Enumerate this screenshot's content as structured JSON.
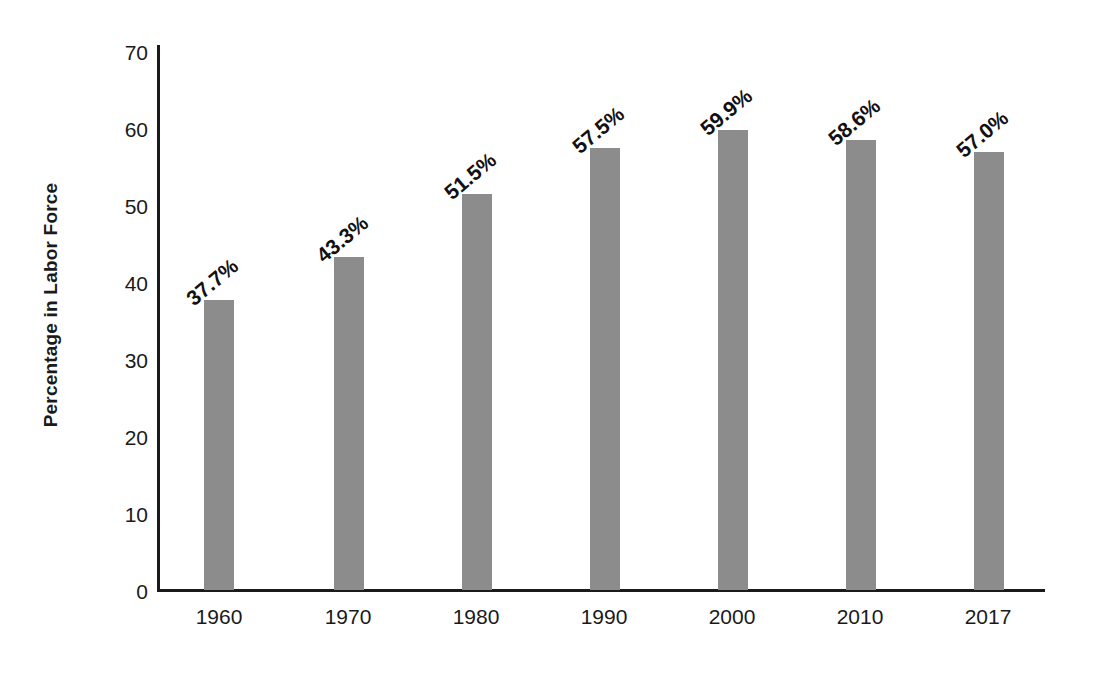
{
  "chart_data": {
    "type": "bar",
    "title": "",
    "xlabel": "",
    "ylabel": "Percentage in Labor Force",
    "categories": [
      "1960",
      "1970",
      "1980",
      "1990",
      "2000",
      "2010",
      "2017"
    ],
    "values": [
      37.7,
      43.3,
      51.5,
      57.5,
      59.9,
      58.6,
      57.0
    ],
    "data_labels": [
      "37.7%",
      "43.3%",
      "51.5%",
      "57.5%",
      "59.9%",
      "58.6%",
      "57.0%"
    ],
    "ylim": [
      0,
      70
    ],
    "y_ticks": [
      "0",
      "10",
      "20",
      "30",
      "40",
      "50",
      "60",
      "70"
    ],
    "y_tick_values": [
      0,
      10,
      20,
      30,
      40,
      50,
      60,
      70
    ],
    "grid": false,
    "legend": null,
    "legend_position": "none",
    "bar_color": "#8c8c8c",
    "axis_color": "#1a1a1a",
    "background_color": "#ffffff",
    "data_label_rotation_degrees": -40
  }
}
